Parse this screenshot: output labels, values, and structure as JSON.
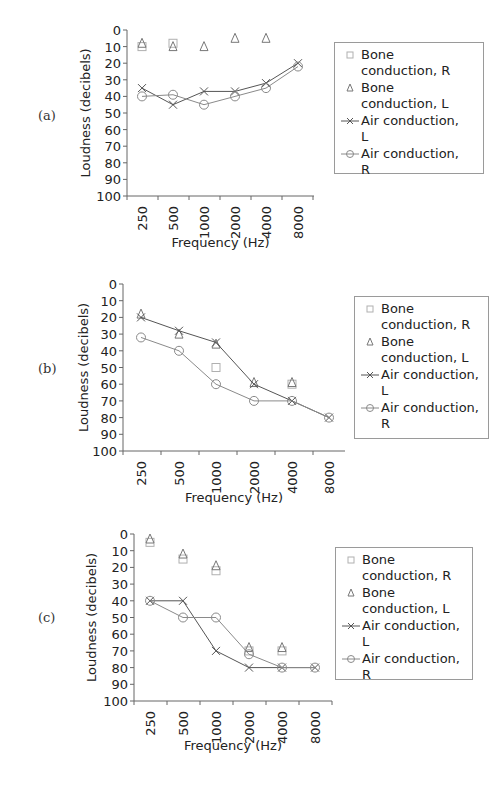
{
  "chart_data": [
    {
      "type": "line",
      "panel_label": "(a)",
      "title": "",
      "xlabel": "Frequency (Hz)",
      "ylabel": "Loudness (decibels)",
      "categories": [
        "250",
        "500",
        "1000",
        "2000",
        "4000",
        "8000"
      ],
      "yticks": [
        "0",
        "10",
        "20",
        "30",
        "40",
        "50",
        "60",
        "70",
        "80",
        "90",
        "100"
      ],
      "ylim": [
        0,
        100
      ],
      "y_inverted": true,
      "grid": false,
      "legend_position": "right",
      "series": [
        {
          "name": "Bone conduction, R",
          "marker": "square",
          "line": false,
          "color": "#b0b0b0",
          "values": [
            10,
            8,
            null,
            null,
            null,
            null
          ]
        },
        {
          "name": "Bone conduction, L",
          "marker": "triangle",
          "line": false,
          "color": "#777777",
          "values": [
            8,
            10,
            10,
            5,
            5,
            null
          ]
        },
        {
          "name": "Air conduction, L",
          "marker": "x",
          "line": true,
          "color": "#555555",
          "values": [
            35,
            45,
            37,
            37,
            32,
            20
          ]
        },
        {
          "name": "Air conduction, R",
          "marker": "circle",
          "line": true,
          "color": "#8a8a8a",
          "values": [
            40,
            39,
            45,
            40,
            35,
            22
          ]
        }
      ]
    },
    {
      "type": "line",
      "panel_label": "(b)",
      "title": "",
      "xlabel": "Frequency (Hz)",
      "ylabel": "Loudness (decibels)",
      "categories": [
        "250",
        "500",
        "1000",
        "2000",
        "4000",
        "8000"
      ],
      "yticks": [
        "0",
        "10",
        "20",
        "30",
        "40",
        "50",
        "60",
        "70",
        "80",
        "90",
        "100"
      ],
      "ylim": [
        0,
        100
      ],
      "y_inverted": true,
      "grid": false,
      "legend_position": "right",
      "series": [
        {
          "name": "Bone conduction, R",
          "marker": "square",
          "line": false,
          "color": "#b0b0b0",
          "values": [
            null,
            null,
            50,
            null,
            60,
            null
          ]
        },
        {
          "name": "Bone conduction, L",
          "marker": "triangle",
          "line": false,
          "color": "#777777",
          "values": [
            18,
            30,
            36,
            59,
            59,
            null
          ]
        },
        {
          "name": "Air conduction, L",
          "marker": "x",
          "line": true,
          "color": "#555555",
          "values": [
            20,
            28,
            35,
            60,
            70,
            80
          ]
        },
        {
          "name": "Air conduction, R",
          "marker": "circle",
          "line": true,
          "color": "#8a8a8a",
          "values": [
            32,
            40,
            60,
            70,
            70,
            80
          ]
        }
      ]
    },
    {
      "type": "line",
      "panel_label": "(c)",
      "title": "",
      "xlabel": "Frequency (Hz)",
      "ylabel": "Loudness (decibels)",
      "categories": [
        "250",
        "500",
        "1000",
        "2000",
        "4000",
        "8000"
      ],
      "yticks": [
        "0",
        "10",
        "20",
        "30",
        "40",
        "50",
        "60",
        "70",
        "80",
        "90",
        "100"
      ],
      "ylim": [
        0,
        100
      ],
      "y_inverted": true,
      "grid": false,
      "legend_position": "right",
      "series": [
        {
          "name": "Bone conduction, R",
          "marker": "square",
          "line": false,
          "color": "#b0b0b0",
          "values": [
            5,
            15,
            22,
            70,
            70,
            null
          ]
        },
        {
          "name": "Bone conduction, L",
          "marker": "triangle",
          "line": false,
          "color": "#777777",
          "values": [
            3,
            12,
            19,
            68,
            68,
            null
          ]
        },
        {
          "name": "Air conduction, L",
          "marker": "x",
          "line": true,
          "color": "#555555",
          "values": [
            40,
            40,
            70,
            80,
            80,
            80
          ]
        },
        {
          "name": "Air conduction, R",
          "marker": "circle",
          "line": true,
          "color": "#8a8a8a",
          "values": [
            40,
            50,
            50,
            72,
            80,
            80
          ]
        }
      ]
    }
  ],
  "legend": {
    "items": [
      {
        "line1": "Bone",
        "line2": "conduction, R"
      },
      {
        "line1": "Bone",
        "line2": "conduction, L"
      },
      {
        "line1": "Air conduction,",
        "line2": "L"
      },
      {
        "line1": "Air conduction,",
        "line2": "R"
      }
    ]
  }
}
